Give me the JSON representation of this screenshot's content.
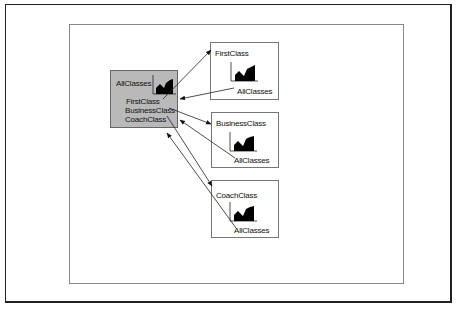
{
  "diagram": {
    "master": {
      "title": "AllClasses",
      "items": [
        "FirstClass",
        "BusinessClass",
        "CoachClass"
      ]
    },
    "details": [
      {
        "title": "FirstClass",
        "link_label": "AllClasses"
      },
      {
        "title": "BusinessClass",
        "link_label": "AllClasses"
      },
      {
        "title": "CoachClass",
        "link_label": "AllClasses"
      }
    ],
    "colors": {
      "master_fill": "#b9b9b9",
      "detail_fill": "#ffffff",
      "chart_fill": "#000000",
      "line": "#222222"
    }
  }
}
